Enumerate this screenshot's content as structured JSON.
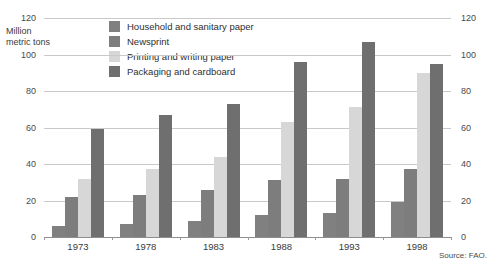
{
  "chart_data": {
    "type": "bar",
    "title": "",
    "subtitle": "",
    "xlabel": "",
    "ylabel": "Million\nmetric tons",
    "ylim": [
      0,
      120
    ],
    "yticks": [
      0,
      20,
      40,
      60,
      80,
      100,
      120
    ],
    "ytick_labels": [
      "0",
      "20",
      "40",
      "60",
      "80",
      "100",
      "120"
    ],
    "grid": true,
    "dual_axis": true,
    "legend_position": "top-center",
    "categories": [
      "1973",
      "1978",
      "1983",
      "1988",
      "1993",
      "1998"
    ],
    "series": [
      {
        "name": "Household and sanitary paper",
        "color": "#808080",
        "values": [
          6,
          7,
          9,
          12,
          13,
          19
        ]
      },
      {
        "name": "Newsprint",
        "color": "#7d7d7d",
        "values": [
          22,
          23,
          26,
          31,
          32,
          37
        ]
      },
      {
        "name": "Printing and writing paper",
        "color": "#d7d7d7",
        "values": [
          32,
          37,
          44,
          63,
          71,
          90
        ]
      },
      {
        "name": "Packaging and cardboard",
        "color": "#6f6f6f",
        "values": [
          59,
          67,
          73,
          96,
          107,
          95
        ]
      }
    ],
    "annotations": {
      "source": "Source: FAO."
    },
    "colors": {
      "background": "#ffffff",
      "gridline": "#c9c9c9",
      "baseline": "#8e8e8e",
      "text": "#3a3a3a"
    }
  }
}
